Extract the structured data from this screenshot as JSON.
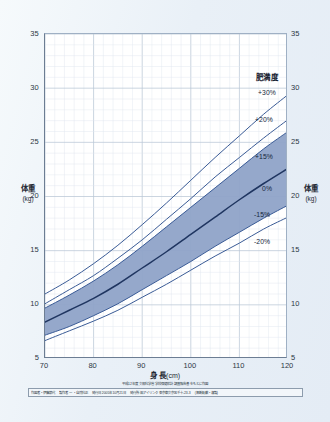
{
  "chart_data": {
    "type": "line",
    "title": "",
    "xlabel": "身 長",
    "xunit": "(cm)",
    "ylabel": "体重",
    "yunit": "(kg)",
    "xlim": [
      70,
      120
    ],
    "ylim": [
      5,
      35
    ],
    "xticks": [
      70,
      80,
      90,
      100,
      110,
      120
    ],
    "yticks": [
      5,
      10,
      15,
      20,
      25,
      30,
      35
    ],
    "grid": true,
    "grid_minor_step_x": 2,
    "grid_minor_step_y": 1,
    "legend_title": "肥満度",
    "legend_position": "upper-right-inside",
    "band": {
      "fill": "#8fa3c8",
      "upper_series": "+15%",
      "lower_series": "-15%"
    },
    "x": [
      70,
      75,
      80,
      85,
      90,
      95,
      100,
      105,
      110,
      115,
      120
    ],
    "series": [
      {
        "name": "+30%",
        "label": "+30%",
        "color": "#3a5b96",
        "values": [
          11.0,
          12.3,
          13.8,
          15.5,
          17.4,
          19.4,
          21.5,
          23.6,
          25.6,
          27.6,
          29.4
        ]
      },
      {
        "name": "+20%",
        "label": "+20%",
        "color": "#3a5b96",
        "values": [
          10.1,
          11.4,
          12.7,
          14.3,
          16.0,
          17.9,
          19.8,
          21.8,
          23.6,
          25.4,
          27.1
        ]
      },
      {
        "name": "+15%",
        "label": "+15%",
        "color": "#3a5b96",
        "values": [
          9.7,
          10.9,
          12.2,
          13.7,
          15.4,
          17.2,
          19.0,
          20.8,
          22.6,
          24.4,
          26.0
        ]
      },
      {
        "name": "0%",
        "label": "0%",
        "color": "#1f3560",
        "values": [
          8.4,
          9.5,
          10.6,
          11.9,
          13.4,
          14.9,
          16.5,
          18.1,
          19.7,
          21.2,
          22.6
        ]
      },
      {
        "name": "-15%",
        "label": "-15%",
        "color": "#3a5b96",
        "values": [
          7.2,
          8.0,
          9.0,
          10.1,
          11.4,
          12.7,
          14.0,
          15.4,
          16.7,
          18.0,
          19.2
        ]
      },
      {
        "name": "-20%",
        "label": "-20%",
        "color": "#3a5b96",
        "values": [
          6.7,
          7.6,
          8.5,
          9.5,
          10.7,
          11.9,
          13.2,
          14.5,
          15.7,
          17.0,
          18.1
        ]
      }
    ]
  },
  "axes": {
    "left_title_cj": "体重",
    "left_unit": "(kg)",
    "right_title_cj": "体重",
    "right_unit": "(kg)",
    "x_title": "身 長",
    "x_unit": "(cm)"
  },
  "footer": {
    "note": "平成12年度 文部科学省 学校保健統計調査報告書 をもとに作図",
    "credits": [
      "作図者・伊藤節代",
      "製作者 一 ・自然科正",
      "発行日 2005年10月21日",
      "発行所 ㈱アイリンク 東京都文京区千十-23-3",
      "(無断転載・複製)"
    ]
  },
  "colors": {
    "page_bg": "#eaf1f8",
    "plot_bg": "#ffffff",
    "band_fill": "#8fa3c8",
    "curve": "#3a5b96",
    "median_curve": "#1f3560",
    "grid_minor": "#dfe7ef",
    "grid_major": "#b9c7d6",
    "axis": "#6c7d93",
    "text": "#1e2833"
  }
}
